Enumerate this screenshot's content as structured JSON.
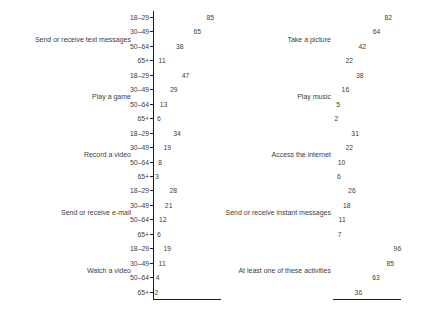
{
  "colors": {
    "text": "#404040",
    "line": "#1a1a1a",
    "background": "#ffffff"
  },
  "chart_data": {
    "type": "dotplot",
    "title": "",
    "xlabel": "",
    "ylabel": "",
    "xlim": [
      0,
      100
    ],
    "value_unit": "percent",
    "legend": "none",
    "grid": false,
    "age_groups": [
      "18–29",
      "30–49",
      "50–64",
      "65+"
    ],
    "panels": [
      {
        "side": "left",
        "shows_age_axis": true,
        "groups": [
          {
            "label": "Send or receive text messages",
            "values": [
              85,
              65,
              38,
              11
            ]
          },
          {
            "label": "Play a game",
            "values": [
              47,
              29,
              13,
              6
            ]
          },
          {
            "label": "Record a video",
            "values": [
              34,
              19,
              8,
              3
            ]
          },
          {
            "label": "Send or receive e-mail",
            "values": [
              28,
              21,
              12,
              6
            ]
          },
          {
            "label": "Watch a video",
            "values": [
              19,
              11,
              4,
              2
            ]
          }
        ]
      },
      {
        "side": "right",
        "shows_age_axis": false,
        "groups": [
          {
            "label": "Take a picture",
            "values": [
              82,
              64,
              42,
              22
            ]
          },
          {
            "label": "Play music",
            "values": [
              38,
              16,
              5,
              2
            ]
          },
          {
            "label": "Access the internet",
            "values": [
              31,
              22,
              10,
              6
            ]
          },
          {
            "label": "Send or receive instant messages",
            "values": [
              26,
              18,
              11,
              7
            ]
          },
          {
            "label": "At least one of these activities",
            "values": [
              96,
              85,
              63,
              36
            ]
          }
        ]
      }
    ]
  }
}
